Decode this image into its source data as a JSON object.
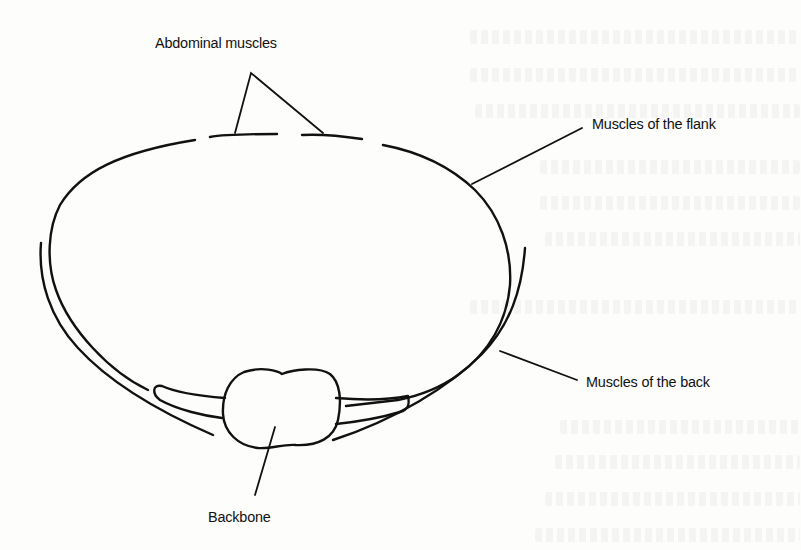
{
  "figure": {
    "type": "anatomical cross-section diagram",
    "labels": {
      "abdominal_muscles": "Abdominal muscles",
      "flank_muscles": "Muscles of the flank",
      "back_muscles": "Muscles of the back",
      "backbone": "Backbone"
    },
    "colors": {
      "ink": "#111111",
      "paper": "#fdfdfc"
    }
  }
}
